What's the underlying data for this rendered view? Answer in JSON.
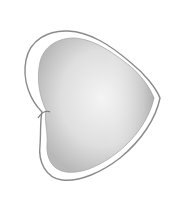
{
  "image": {
    "subject": "heart-shape-sketch",
    "style": "pencil shaded drawing",
    "colors": {
      "background": "#ffffff",
      "outline": "#8a8a8a",
      "shade_dark": "#9a9a9a",
      "shade_light": "#e4e4e4"
    }
  }
}
